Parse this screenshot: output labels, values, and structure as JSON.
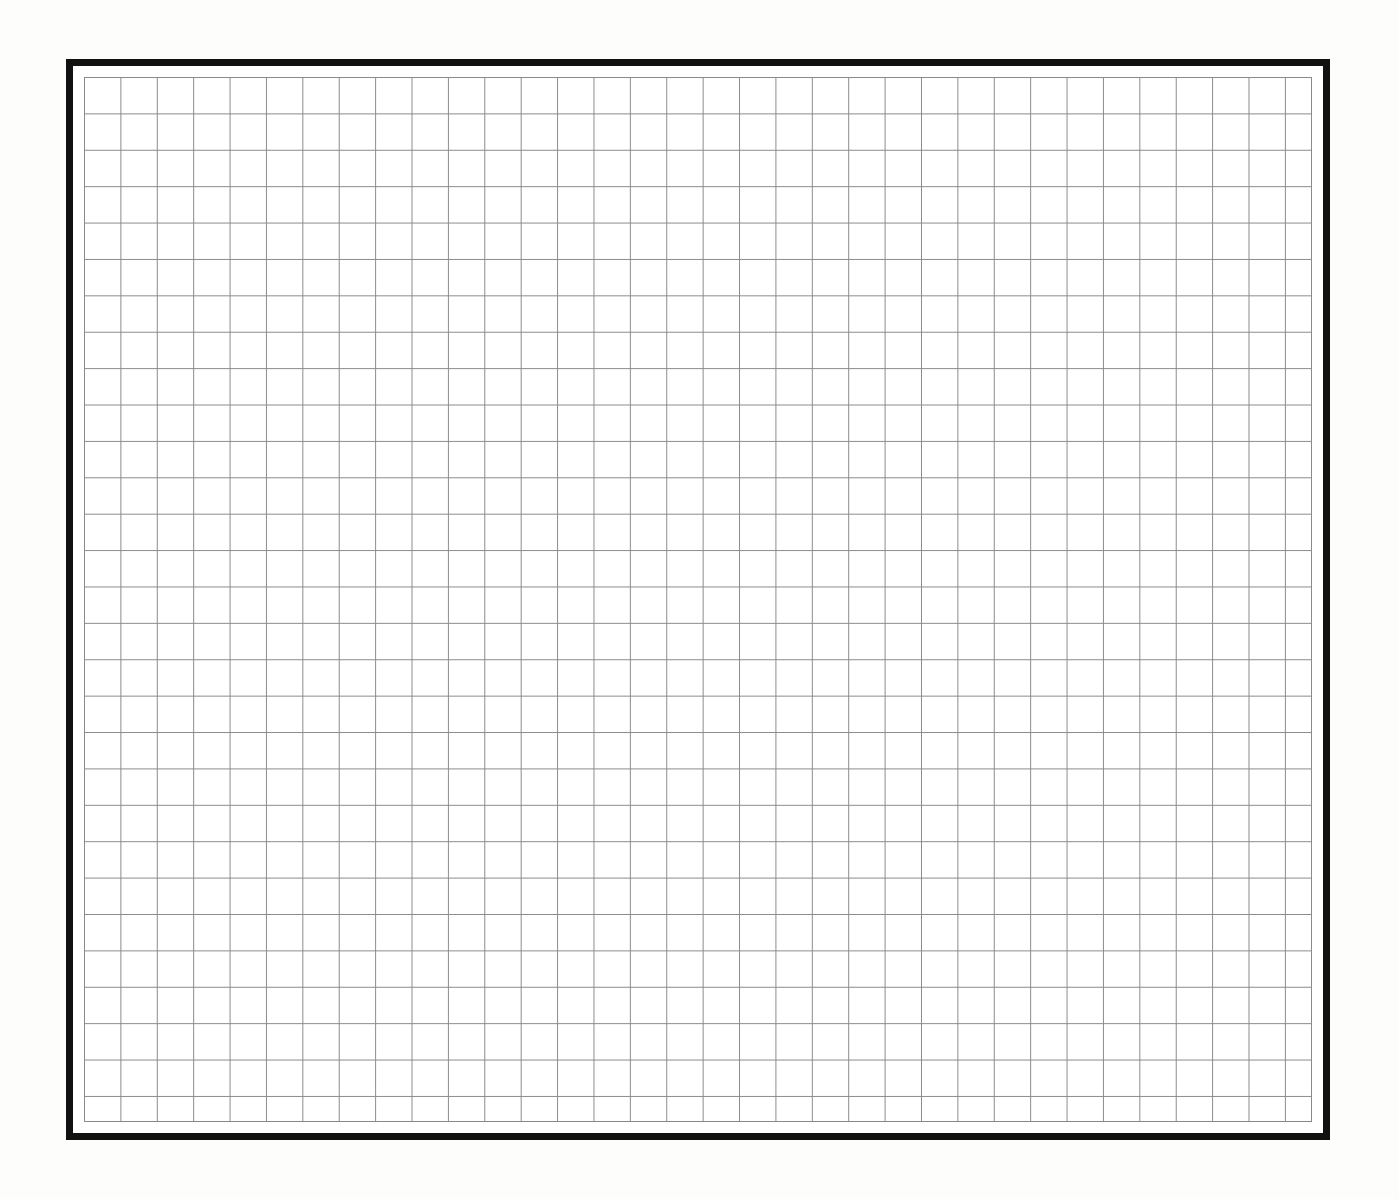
{
  "document": {
    "kind": "blank-grid-sheet",
    "title": "Blank Grid Sheet",
    "description": "Scanned blank graph-paper sheet with a heavy black rectangular border enclosing a uniform ruled grid",
    "text_content": "",
    "page_background_color": "#fdfdfc"
  },
  "frame": {
    "name": "outer-black-border",
    "color": "#111111",
    "border_width_px": 7,
    "left_px": 66,
    "top_px": 59,
    "width_px": 1264,
    "height_px": 1081,
    "inner_margin_color": "#ffffff",
    "inner_margin_px": 4
  },
  "grid": {
    "name": "ruled-grid",
    "line_color": "#8a8a8a",
    "line_width_px": 1,
    "cell_size_px": 36.4,
    "columns": 34,
    "rows": 29,
    "left_px": 84,
    "top_px": 77,
    "width_px": 1228,
    "height_px": 1045,
    "background_color": "#ffffff",
    "sub_grid": false
  },
  "chart_data": {
    "type": "table",
    "title": "",
    "xlabel": "",
    "ylabel": "",
    "categories": [],
    "values": [],
    "series": [],
    "annotations": [],
    "legend": [],
    "grid": true,
    "note": "Empty grid — no plotted data, labels, ticks or legend are present in the image"
  }
}
